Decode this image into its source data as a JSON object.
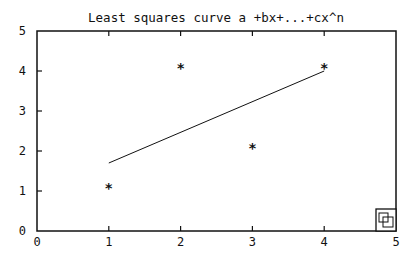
{
  "chart_data": {
    "type": "scatter",
    "title_display": "Least squares curve a +bx+...+cx^n",
    "xlabel": "",
    "ylabel": "",
    "xlim": [
      0,
      5
    ],
    "ylim": [
      0,
      5
    ],
    "x_ticks": [
      "0",
      "1",
      "2",
      "3",
      "4",
      "5"
    ],
    "y_ticks": [
      "0",
      "1",
      "2",
      "3",
      "4",
      "5"
    ],
    "grid": false,
    "legend": null,
    "series": [
      {
        "name": "data points",
        "type": "scatter",
        "marker": "*",
        "x": [
          1,
          2,
          3,
          4
        ],
        "y": [
          1.1,
          4.1,
          2.1,
          4.1
        ]
      },
      {
        "name": "least squares fit",
        "type": "line",
        "x": [
          1,
          4
        ],
        "y": [
          1.7,
          4.0
        ]
      }
    ]
  },
  "ui": {
    "zoom_icon": "window-zoom-icon",
    "line_color": "#111111",
    "background": "#ffffff"
  }
}
